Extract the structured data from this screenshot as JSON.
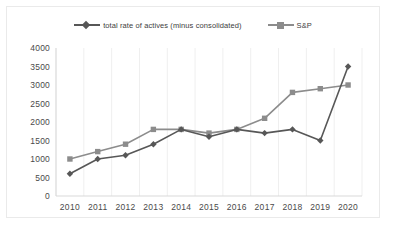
{
  "chart_data": {
    "type": "line",
    "title": "",
    "xlabel": "",
    "ylabel": "",
    "categories": [
      "2010",
      "2011",
      "2012",
      "2013",
      "2014",
      "2015",
      "2016",
      "2017",
      "2018",
      "2019",
      "2020"
    ],
    "series": [
      {
        "name": "total rate of actives (minus consolidated)",
        "marker": "diamond",
        "color": "#575757",
        "values": [
          600,
          1000,
          1100,
          1400,
          1800,
          1600,
          1800,
          1700,
          1800,
          1500,
          3500
        ]
      },
      {
        "name": "S&P",
        "marker": "square",
        "color": "#8c8c8c",
        "values": [
          1000,
          1200,
          1400,
          1800,
          1800,
          1700,
          1800,
          2100,
          2800,
          2900,
          3000
        ]
      }
    ],
    "ylim": [
      0,
      4000
    ],
    "yticks": [
      0,
      500,
      1000,
      1500,
      2000,
      2500,
      3000,
      3500,
      4000
    ],
    "ytick_labels": [
      "0",
      "500",
      "1000",
      "1500",
      "2000",
      "2500",
      "3000",
      "3500",
      "4000"
    ],
    "grid": "vertical",
    "legend_position": "top"
  },
  "legend": {
    "entries": [
      {
        "label": "total rate of actives (minus consolidated)",
        "marker": "diamond-marker-icon",
        "color": "#575757"
      },
      {
        "label": "S&P",
        "marker": "square-marker-icon",
        "color": "#8c8c8c"
      }
    ]
  },
  "colors": {
    "series_actives": "#575757",
    "series_sp": "#8c8c8c",
    "gridline": "#efefef",
    "axis": "#d9d9d9",
    "border": "#eaeaea",
    "text": "#4a4a4a",
    "background": "#ffffff"
  }
}
